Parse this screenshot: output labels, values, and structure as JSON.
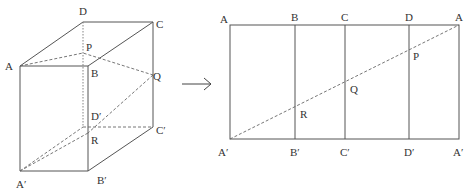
{
  "left_figure": {
    "description": "rectangular prism with path on faces",
    "labels": {
      "A": "A",
      "B": "B",
      "C": "C",
      "D": "D",
      "A_prime": "A′",
      "B_prime": "B′",
      "C_prime": "C′",
      "D_prime": "D′",
      "P": "P",
      "Q": "Q",
      "R": "R"
    }
  },
  "arrow": {
    "icon": "right-arrow-icon"
  },
  "right_figure": {
    "description": "net (unfolded lateral faces) of the prism",
    "top_labels": [
      "A",
      "B",
      "C",
      "D",
      "A"
    ],
    "bottom_labels": [
      "A′",
      "B′",
      "C′",
      "D′",
      "A′"
    ],
    "point_labels": {
      "P": "P",
      "Q": "Q",
      "R": "R"
    }
  }
}
